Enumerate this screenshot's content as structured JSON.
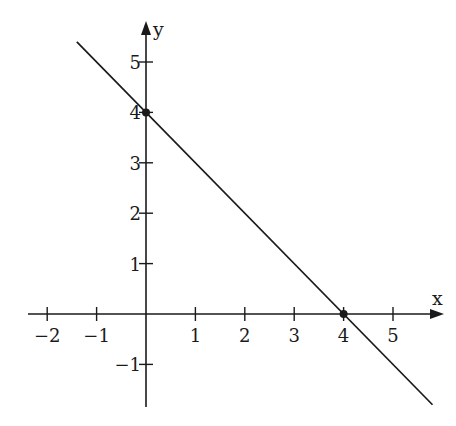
{
  "chart_data": {
    "type": "line",
    "title": "",
    "xlabel": "x",
    "ylabel": "y",
    "xlim": [
      -2.4,
      5.9
    ],
    "ylim": [
      -1.85,
      5.8
    ],
    "grid": false,
    "legend": null,
    "x_ticks": [
      -2,
      -1,
      1,
      2,
      3,
      4,
      5
    ],
    "x_tick_labels": [
      "−2",
      "−1",
      "1",
      "2",
      "3",
      "4",
      "5"
    ],
    "y_ticks": [
      -1,
      1,
      2,
      3,
      4,
      5
    ],
    "y_tick_labels": [
      "−1",
      "1",
      "2",
      "3",
      "4",
      "5"
    ],
    "series": [
      {
        "name": "line",
        "equation": "y = -x + 4",
        "slope": -1,
        "intercept": 4,
        "x": [
          -1.4,
          5.8
        ],
        "y": [
          5.4,
          -1.8
        ],
        "color": "#1a1a1a"
      }
    ],
    "points": [
      {
        "label": "y-intercept",
        "x": 0,
        "y": 4
      },
      {
        "label": "x-intercept",
        "x": 4,
        "y": 0
      }
    ]
  },
  "axes": {
    "x_label": "x",
    "y_label": "y"
  },
  "colors": {
    "ink": "#1a1a1a",
    "background": "#ffffff"
  }
}
